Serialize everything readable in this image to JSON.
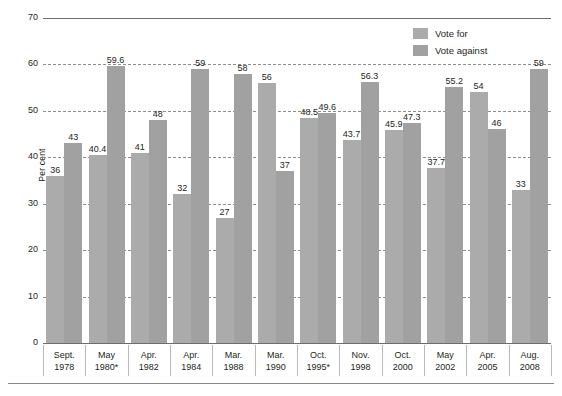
{
  "chart_data": {
    "type": "bar",
    "title": "",
    "xlabel": "",
    "ylabel": "Per cent",
    "ylim": [
      0,
      70
    ],
    "yticks": [
      0,
      10,
      20,
      30,
      40,
      50,
      60,
      70
    ],
    "grid": true,
    "legend_position": "top-right",
    "categories": [
      "Sept.\n1978",
      "May\n1980*",
      "Apr.\n1982",
      "Apr.\n1984",
      "Mar.\n1988",
      "Mar.\n1990",
      "Oct.\n1995*",
      "Nov.\n1998",
      "Oct.\n2000",
      "May\n2002",
      "Apr.\n2005",
      "Aug.\n2008"
    ],
    "category_lines": [
      {
        "top": "Sept.",
        "bottom": "1978"
      },
      {
        "top": "May",
        "bottom": "1980*"
      },
      {
        "top": "Apr.",
        "bottom": "1982"
      },
      {
        "top": "Apr.",
        "bottom": "1984"
      },
      {
        "top": "Mar.",
        "bottom": "1988"
      },
      {
        "top": "Mar.",
        "bottom": "1990"
      },
      {
        "top": "Oct.",
        "bottom": "1995*"
      },
      {
        "top": "Nov.",
        "bottom": "1998"
      },
      {
        "top": "Oct.",
        "bottom": "2000"
      },
      {
        "top": "May",
        "bottom": "2002"
      },
      {
        "top": "Apr.",
        "bottom": "2005"
      },
      {
        "top": "Aug.",
        "bottom": "2008"
      }
    ],
    "series": [
      {
        "name": "Vote for",
        "color": "#ababab",
        "values": [
          36,
          40.4,
          41,
          32,
          27,
          56,
          48.5,
          43.7,
          45.9,
          37.7,
          54,
          33
        ],
        "labels": [
          "36",
          "40.4",
          "41",
          "32",
          "27",
          "56",
          "48.5",
          "43.7",
          "45.9",
          "37.7",
          "54",
          "33"
        ]
      },
      {
        "name": "Vote against",
        "color": "#a1a1a1",
        "values": [
          43,
          59.6,
          48,
          59,
          58,
          37,
          49.6,
          56.3,
          47.3,
          55.2,
          46,
          59
        ],
        "labels": [
          "43",
          "59.6",
          "48",
          "59",
          "58",
          "37",
          "49.6",
          "56.3",
          "47.3",
          "55.2",
          "46",
          "59"
        ]
      }
    ]
  },
  "legend": {
    "items": [
      {
        "label": "Vote for",
        "color": "#ababab"
      },
      {
        "label": "Vote against",
        "color": "#a1a1a1"
      }
    ]
  },
  "axis": {
    "y_title": "Per cent",
    "y_tick_labels": [
      "70",
      "60",
      "50",
      "40",
      "30",
      "20",
      "10",
      "0"
    ]
  }
}
